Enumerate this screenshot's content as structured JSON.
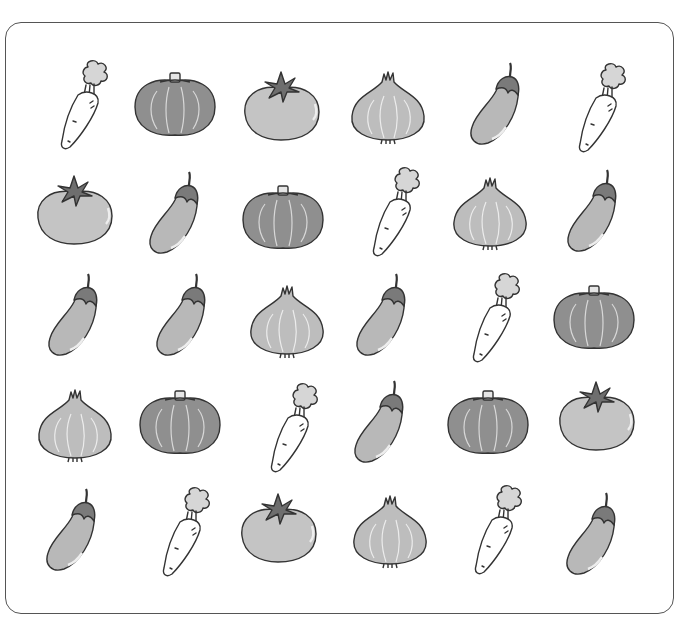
{
  "worksheet": {
    "title": "",
    "rows": [
      [
        "carrot",
        "pumpkin",
        "tomato",
        "onion",
        "eggplant",
        "carrot"
      ],
      [
        "tomato",
        "eggplant",
        "pumpkin",
        "carrot",
        "onion",
        "eggplant"
      ],
      [
        "eggplant",
        "eggplant",
        "onion",
        "eggplant",
        "carrot",
        "pumpkin"
      ],
      [
        "onion",
        "pumpkin",
        "carrot",
        "eggplant",
        "pumpkin",
        "tomato"
      ],
      [
        "eggplant",
        "carrot",
        "tomato",
        "onion",
        "carrot",
        "eggplant"
      ]
    ],
    "cell_centers": [
      [
        [
          78,
          105
        ],
        [
          175,
          105
        ],
        [
          281,
          108
        ],
        [
          388,
          106
        ],
        [
          496,
          105
        ],
        [
          596,
          108
        ]
      ],
      [
        [
          74,
          212
        ],
        [
          175,
          214
        ],
        [
          283,
          218
        ],
        [
          390,
          212
        ],
        [
          490,
          212
        ],
        [
          593,
          212
        ]
      ],
      [
        [
          74,
          316
        ],
        [
          182,
          316
        ],
        [
          287,
          320
        ],
        [
          382,
          316
        ],
        [
          490,
          318
        ],
        [
          594,
          318
        ]
      ],
      [
        [
          75,
          424
        ],
        [
          180,
          423
        ],
        [
          288,
          428
        ],
        [
          380,
          423
        ],
        [
          488,
          423
        ],
        [
          596,
          418
        ]
      ],
      [
        [
          72,
          531
        ],
        [
          180,
          532
        ],
        [
          278,
          530
        ],
        [
          390,
          530
        ],
        [
          492,
          530
        ],
        [
          592,
          535
        ]
      ]
    ]
  },
  "colors": {
    "frame_border": "#555555",
    "outline": "#333333",
    "pumpkin_fill": "#8f8f8f",
    "tomato_fill": "#c4c4c4",
    "tomato_leaf": "#6e6e6e",
    "onion_fill": "#bdbdbd",
    "eggplant_fill": "#b8b8b8",
    "eggplant_cap": "#7a7a7a",
    "carrot_fill": "#ffffff",
    "carrot_leaf": "#d6d6d6"
  }
}
